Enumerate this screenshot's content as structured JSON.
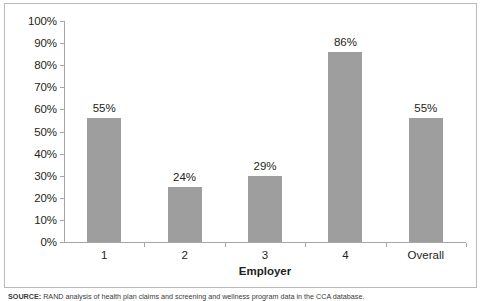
{
  "figure": {
    "source_note_lead": "SOURCE:",
    "source_note_text": " RAND analysis of health plan claims and screening and wellness program data in the CCA database."
  },
  "colors": {
    "bar_fill": "#9e9e9e",
    "axis_line": "#a6a6a6",
    "frame_border": "#b9b9b9",
    "text": "#231f20",
    "background": "#ffffff"
  },
  "chart_data": {
    "type": "bar",
    "title": "",
    "subtitle": "",
    "xlabel": "Employer",
    "ylabel": "",
    "categories": [
      "1",
      "2",
      "3",
      "4",
      "Overall"
    ],
    "values": [
      55,
      24,
      29,
      86,
      55
    ],
    "bar_top_percent": [
      56,
      25,
      30,
      86,
      56
    ],
    "data_labels": [
      "55%",
      "24%",
      "29%",
      "86%",
      "55%"
    ],
    "ylim": [
      0,
      100
    ],
    "y_ticks": [
      0,
      10,
      20,
      30,
      40,
      50,
      60,
      70,
      80,
      90,
      100
    ],
    "y_tick_labels": [
      "0%",
      "10%",
      "20%",
      "30%",
      "40%",
      "50%",
      "60%",
      "70%",
      "80%",
      "90%",
      "100%"
    ],
    "grid": false,
    "legend": false,
    "legend_position": "none",
    "series": [
      {
        "name": "Percentage",
        "values": [
          55,
          24,
          29,
          86,
          55
        ]
      }
    ]
  }
}
